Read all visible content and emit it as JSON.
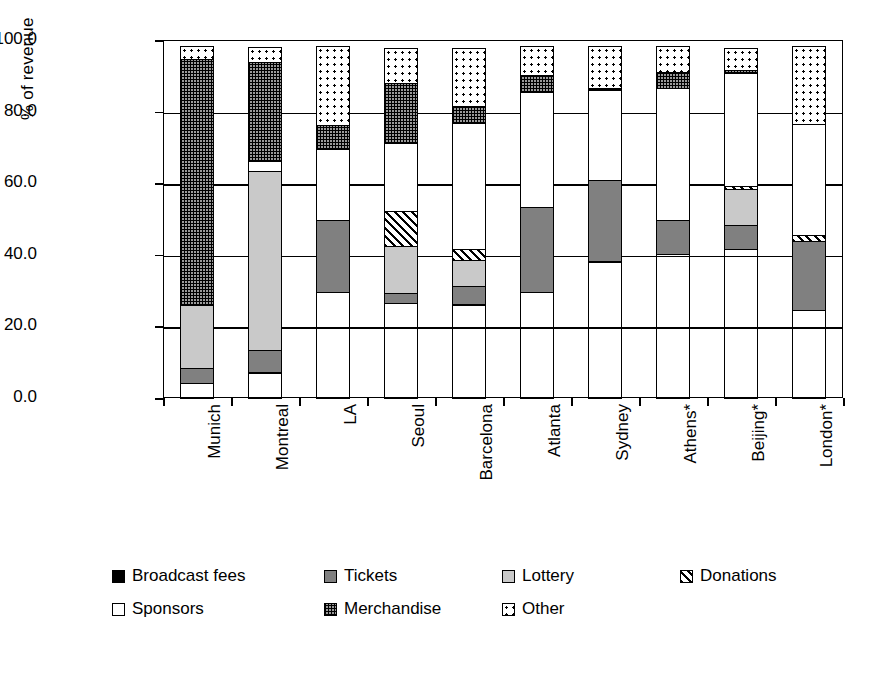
{
  "chart_data": {
    "type": "bar",
    "subtype": "stacked-100-percent",
    "title": "",
    "xlabel": "",
    "ylabel": "% of revenue",
    "ylim": [
      0,
      100
    ],
    "yticks": [
      "0.0",
      "20.0",
      "40.0",
      "60.0",
      "80.0",
      "100.0"
    ],
    "ytick_values": [
      0,
      20,
      40,
      60,
      80,
      100
    ],
    "grid": true,
    "legend_position": "bottom",
    "categories": [
      "Munich",
      "Montreal",
      "LA",
      "Seoul",
      "Barcelona",
      "Atlanta",
      "Sydney",
      "Athens*",
      "Beijing*",
      "London*"
    ],
    "series": [
      {
        "name": "Broadcast fees",
        "pattern": "solid-black",
        "color": "#000000",
        "values": [
          4.5,
          7.5,
          30.0,
          27.0,
          26.5,
          30.0,
          38.5,
          40.5,
          42.0,
          25.0
        ]
      },
      {
        "name": "Tickets",
        "pattern": "solid-gray",
        "color": "#808080",
        "values": [
          4.5,
          6.5,
          20.5,
          3.0,
          5.5,
          24.0,
          23.0,
          10.0,
          7.0,
          19.5
        ]
      },
      {
        "name": "Lottery",
        "pattern": "solid-light",
        "color": "#c9c9c9",
        "values": [
          18.0,
          50.5,
          0.0,
          13.5,
          7.5,
          0.0,
          0.0,
          0.0,
          10.5,
          0.0
        ]
      },
      {
        "name": "Donations",
        "pattern": "diagonal-hatch",
        "color": "#ffffff",
        "values": [
          0.0,
          0.0,
          0.0,
          10.0,
          3.5,
          0.0,
          0.0,
          0.0,
          1.0,
          2.0
        ]
      },
      {
        "name": "Sponsors",
        "pattern": "white",
        "color": "#ffffff",
        "values": [
          0.0,
          3.0,
          20.0,
          19.5,
          35.5,
          32.5,
          25.5,
          37.0,
          32.0,
          31.5
        ]
      },
      {
        "name": "Merchandise",
        "pattern": "checker",
        "color": "#9a9a9a",
        "values": [
          69.0,
          28.0,
          7.0,
          17.0,
          5.0,
          5.0,
          1.0,
          5.0,
          1.0,
          0.0
        ]
      },
      {
        "name": "Other",
        "pattern": "dotted",
        "color": "#ffffff",
        "values": [
          4.0,
          4.5,
          22.5,
          10.0,
          16.5,
          8.5,
          12.0,
          7.5,
          6.5,
          22.0
        ]
      }
    ]
  },
  "axis": {
    "y_title": "% of revenue",
    "y_tick_labels": [
      "100.0",
      "80.0",
      "60.0",
      "40.0",
      "20.0",
      "0.0"
    ],
    "x_tick_labels": [
      "Munich",
      "Montreal",
      "LA",
      "Seoul",
      "Barcelona",
      "Atlanta",
      "Sydney",
      "Athens*",
      "Beijing*",
      "London*"
    ]
  },
  "legend": {
    "rows": [
      [
        {
          "label": "Broadcast fees",
          "key": "broadcast",
          "left": 0
        },
        {
          "label": "Tickets",
          "key": "tickets",
          "left": 212
        },
        {
          "label": "Lottery",
          "key": "lottery",
          "left": 390
        },
        {
          "label": "Donations",
          "key": "donations",
          "left": 568
        }
      ],
      [
        {
          "label": "Sponsors",
          "key": "sponsors",
          "left": 0
        },
        {
          "label": "Merchandise",
          "key": "merchandise",
          "left": 212
        },
        {
          "label": "Other",
          "key": "other",
          "left": 390
        }
      ]
    ]
  }
}
